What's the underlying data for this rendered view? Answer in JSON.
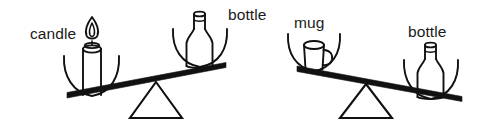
{
  "figure": {
    "background_color": "#ffffff",
    "ink_color": "#111111",
    "text_color": "#1a1a1a",
    "width": 478,
    "height": 126
  },
  "scales": [
    {
      "id": "left-scale",
      "left_pan": {
        "object": "candle",
        "label": "candle",
        "position": "down"
      },
      "right_pan": {
        "object": "bottle",
        "label": "bottle",
        "position": "up"
      },
      "tilt": "left-down",
      "heavier_side": "left"
    },
    {
      "id": "right-scale",
      "left_pan": {
        "object": "mug",
        "label": "mug",
        "position": "up"
      },
      "right_pan": {
        "object": "bottle",
        "label": "bottle",
        "position": "down"
      },
      "tilt": "right-down",
      "heavier_side": "right"
    }
  ],
  "labels": {
    "candle": "candle",
    "bottle_left": "bottle",
    "mug": "mug",
    "bottle_right": "bottle"
  }
}
